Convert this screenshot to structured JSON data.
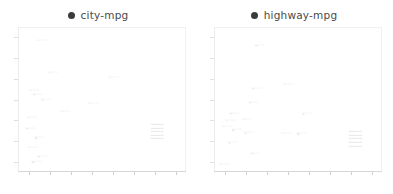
{
  "chart_data": [
    {
      "type": "scatter",
      "title": "city-mpg",
      "legend_label": "city-mpg",
      "legend_marker": "dot-icon",
      "legend_position": "top-center",
      "marker_color": "#3b3b3b",
      "xlabel": "",
      "ylabel": "",
      "grid": false,
      "xlim": [
        0,
        8
      ],
      "ylim": [
        0,
        7
      ],
      "xticks": [
        "",
        "",
        "",
        "",
        "",
        "",
        "",
        ""
      ],
      "yticks": [
        "",
        "",
        "",
        "",
        "",
        "",
        ""
      ],
      "points": [
        {
          "x": 0.98,
          "y": 6.32,
          "label": "point-label"
        },
        {
          "x": 1.52,
          "y": 4.78,
          "label": "point-label"
        },
        {
          "x": 0.62,
          "y": 3.92,
          "label": "point-label"
        },
        {
          "x": 0.78,
          "y": 3.74,
          "label": "point-label"
        },
        {
          "x": 1.18,
          "y": 3.46,
          "label": "point-label"
        },
        {
          "x": 4.38,
          "y": 4.56,
          "label": "point-label"
        },
        {
          "x": 3.42,
          "y": 3.28,
          "label": "point-label"
        },
        {
          "x": 0.52,
          "y": 2.62,
          "label": "point-label"
        },
        {
          "x": 2.12,
          "y": 2.92,
          "label": "point-label"
        },
        {
          "x": 0.44,
          "y": 2.08,
          "label": "point-label"
        },
        {
          "x": 0.88,
          "y": 1.62,
          "label": "point-label"
        },
        {
          "x": 0.56,
          "y": 1.18,
          "label": "point-label"
        },
        {
          "x": 1.02,
          "y": 0.72,
          "label": "point-label"
        },
        {
          "x": 0.72,
          "y": 0.46,
          "label": "point-label"
        },
        {
          "x": 6.62,
          "y": 1.92,
          "label": "dense-cluster"
        }
      ]
    },
    {
      "type": "scatter",
      "title": "highway-mpg",
      "legend_label": "highway-mpg",
      "legend_marker": "dot-icon",
      "legend_position": "top-center",
      "marker_color": "#3b3b3b",
      "xlabel": "",
      "ylabel": "",
      "grid": false,
      "xlim": [
        0,
        8
      ],
      "ylim": [
        0,
        7
      ],
      "xticks": [
        "",
        "",
        "",
        "",
        "",
        "",
        "",
        ""
      ],
      "yticks": [
        "",
        "",
        "",
        "",
        "",
        "",
        ""
      ],
      "points": [
        {
          "x": 2.02,
          "y": 6.08,
          "label": "point-label"
        },
        {
          "x": 1.88,
          "y": 4.02,
          "label": "point-label"
        },
        {
          "x": 3.42,
          "y": 4.22,
          "label": "point-label"
        },
        {
          "x": 1.72,
          "y": 3.34,
          "label": "point-label"
        },
        {
          "x": 0.82,
          "y": 2.82,
          "label": "point-label"
        },
        {
          "x": 4.28,
          "y": 2.78,
          "label": "point-label"
        },
        {
          "x": 1.42,
          "y": 2.52,
          "label": "point-label"
        },
        {
          "x": 0.62,
          "y": 2.46,
          "label": "point-label"
        },
        {
          "x": 0.48,
          "y": 2.18,
          "label": "point-label"
        },
        {
          "x": 0.92,
          "y": 2.02,
          "label": "point-label"
        },
        {
          "x": 1.52,
          "y": 1.86,
          "label": "point-label"
        },
        {
          "x": 3.28,
          "y": 1.84,
          "label": "point-label"
        },
        {
          "x": 4.02,
          "y": 1.82,
          "label": "point-label"
        },
        {
          "x": 0.74,
          "y": 1.38,
          "label": "point-label"
        },
        {
          "x": 1.82,
          "y": 0.88,
          "label": "point-label"
        },
        {
          "x": 0.36,
          "y": 0.36,
          "label": "point-label"
        },
        {
          "x": 6.72,
          "y": 1.58,
          "label": "dense-cluster"
        }
      ]
    }
  ]
}
